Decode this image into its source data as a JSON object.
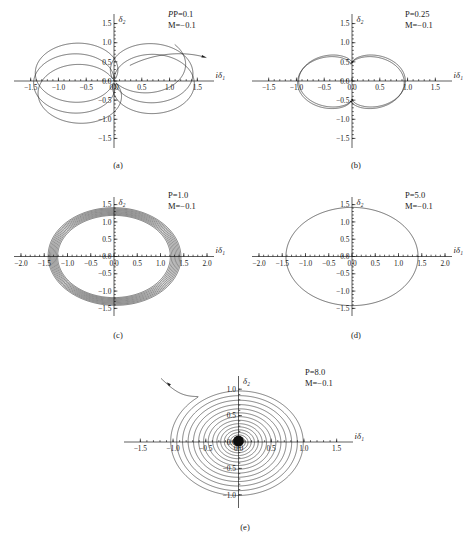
{
  "figure": {
    "axis_labels": {
      "x": "iδ₁",
      "y": "δ₂"
    },
    "panels": [
      {
        "caption": "(a)",
        "P_label": "P=0.1",
        "M_label": "M=−0.1",
        "x_ticks": [
          "−1.5",
          "−1.0",
          "−0.5",
          "0.0",
          "0.5",
          "1.0",
          "1.5"
        ],
        "y_ticks": [
          "1.5",
          "1.0",
          "0.5",
          "0.0",
          "−0.5",
          "−1.0",
          "−1.5"
        ],
        "xlim": [
          -1.8,
          1.8
        ],
        "ylim": [
          -1.75,
          1.75
        ]
      },
      {
        "caption": "(b)",
        "P_label": "P=0.25",
        "M_label": "M=−0.1",
        "x_ticks": [
          "−1.5",
          "−1.0",
          "−0.5",
          "0.0",
          "0.5",
          "1.0",
          "1.5"
        ],
        "y_ticks": [
          "1.5",
          "1.0",
          "0.5",
          "0.0",
          "−0.5",
          "−1.0",
          "−1.5"
        ],
        "xlim": [
          -1.8,
          1.8
        ],
        "ylim": [
          -1.75,
          1.75
        ]
      },
      {
        "caption": "(c)",
        "P_label": "P=1.0",
        "M_label": "M=−0.1",
        "x_ticks": [
          "−2.0",
          "−1.5",
          "−1.0",
          "−0.5",
          "0.0",
          "0.5",
          "1.0",
          "1.5",
          "2.0"
        ],
        "y_ticks": [
          "1.5",
          "1.0",
          "0.5",
          "0.0",
          "−0.5",
          "−1.0",
          "−1.5"
        ],
        "xlim": [
          -2.15,
          2.15
        ],
        "ylim": [
          -1.72,
          1.72
        ]
      },
      {
        "caption": "(d)",
        "P_label": "P=5.0",
        "M_label": "M=−0.1",
        "x_ticks": [
          "−2.0",
          "−1.5",
          "−1.0",
          "−0.5",
          "0.0",
          "0.5",
          "1.0",
          "1.5",
          "2.0"
        ],
        "y_ticks": [
          "1.5",
          "1.0",
          "0.5",
          "0.0",
          "−0.5",
          "−1.0",
          "−1.5"
        ],
        "xlim": [
          -2.15,
          2.15
        ],
        "ylim": [
          -1.72,
          1.72
        ]
      },
      {
        "caption": "(e)",
        "P_label": "P=8.0",
        "M_label": "M=−0.1",
        "x_ticks": [
          "−1.5",
          "−1.0",
          "−0.5",
          "0.0",
          "0.5",
          "1.0",
          "1.5"
        ],
        "y_ticks": [
          "1.0",
          "0.5",
          "0.0",
          "−0.5",
          "−1.0"
        ],
        "xlim": [
          -1.75,
          1.75
        ],
        "ylim": [
          -1.25,
          1.25
        ]
      }
    ]
  },
  "chart_data": [
    {
      "id": "a",
      "type": "line",
      "title": "P=0.1, M=−0.1",
      "xlabel": "iδ₁",
      "ylabel": "δ₂",
      "xlim": [
        -1.8,
        1.8
      ],
      "ylim": [
        -1.75,
        1.75
      ],
      "xticks": [
        -1.5,
        -1.0,
        -0.5,
        0.0,
        0.5,
        1.0,
        1.5
      ],
      "yticks": [
        1.5,
        1.0,
        0.5,
        0.0,
        -0.5,
        -1.0,
        -1.5
      ],
      "grid": false,
      "legend": "none",
      "description": "Multi-petal rosette orbit, slowly precessing narrow ellipses",
      "curve_model": "rosette",
      "r_max": 1.45,
      "r_min": 0.06,
      "petals": 5.5,
      "turns": 5.5,
      "arrow": {
        "x": 1.05,
        "y": 1.02,
        "angle_deg": -22
      }
    },
    {
      "id": "b",
      "type": "line",
      "title": "P=0.25, M=−0.1",
      "xlabel": "iδ₁",
      "ylabel": "δ₂",
      "xlim": [
        -1.8,
        1.8
      ],
      "ylim": [
        -1.75,
        1.75
      ],
      "xticks": [
        -1.5,
        -1.0,
        -0.5,
        0.0,
        0.5,
        1.0,
        1.5
      ],
      "yticks": [
        1.5,
        1.0,
        0.5,
        0.0,
        -0.5,
        -1.0,
        -1.5
      ],
      "grid": false,
      "legend": "none",
      "description": "Three-lobed trefoil orbit",
      "curve_model": "trefoil",
      "r_max": 1.45,
      "r_min": 0.42,
      "petals": 3,
      "turns": 3
    },
    {
      "id": "c",
      "type": "line",
      "title": "P=1.0, M=−0.1",
      "xlabel": "iδ₁",
      "ylabel": "δ₂",
      "xlim": [
        -2.15,
        2.15
      ],
      "ylim": [
        -1.72,
        1.72
      ],
      "xticks": [
        -2.0,
        -1.5,
        -1.0,
        -0.5,
        0.0,
        0.5,
        1.0,
        1.5,
        2.0
      ],
      "yticks": [
        1.5,
        1.0,
        0.5,
        0.0,
        -0.5,
        -1.0,
        -1.5
      ],
      "grid": false,
      "legend": "none",
      "description": "Dense bundle of nested near-circular orbits",
      "curve_model": "nested_rings",
      "r_outer": 1.42,
      "r_inner": 1.2,
      "rings": 9
    },
    {
      "id": "d",
      "type": "line",
      "title": "P=5.0, M=−0.1",
      "xlabel": "iδ₁",
      "ylabel": "δ₂",
      "xlim": [
        -2.15,
        2.15
      ],
      "ylim": [
        -1.72,
        1.72
      ],
      "xticks": [
        -2.0,
        -1.5,
        -1.0,
        -0.5,
        0.0,
        0.5,
        1.0,
        1.5,
        2.0
      ],
      "yticks": [
        1.5,
        1.0,
        0.5,
        0.0,
        -0.5,
        -1.0,
        -1.5
      ],
      "grid": false,
      "legend": "none",
      "description": "Single closed circular orbit",
      "curve_model": "circle",
      "radius": 1.42
    },
    {
      "id": "e",
      "type": "line",
      "title": "P=8.0, M=−0.1",
      "xlabel": "iδ₁",
      "ylabel": "δ₂",
      "xlim": [
        -1.75,
        1.75
      ],
      "ylim": [
        -1.25,
        1.25
      ],
      "xticks": [
        -1.5,
        -1.0,
        -0.5,
        0.0,
        0.5,
        1.0,
        1.5
      ],
      "yticks": [
        1.0,
        0.5,
        0.0,
        -0.5,
        -1.0
      ],
      "grid": false,
      "legend": "none",
      "description": "Inward spiral from r≈1.05 collapsing onto origin, with incoming tail and arrowhead at upper left",
      "curve_model": "spiral",
      "r_start": 1.05,
      "r_end": 0.02,
      "turns": 17,
      "tail": {
        "from_x": -1.18,
        "from_y": 1.2,
        "to_x": -0.62,
        "to_y": 0.86
      },
      "arrow": {
        "x": -1.1,
        "y": 1.13,
        "angle_deg": -140
      }
    }
  ]
}
